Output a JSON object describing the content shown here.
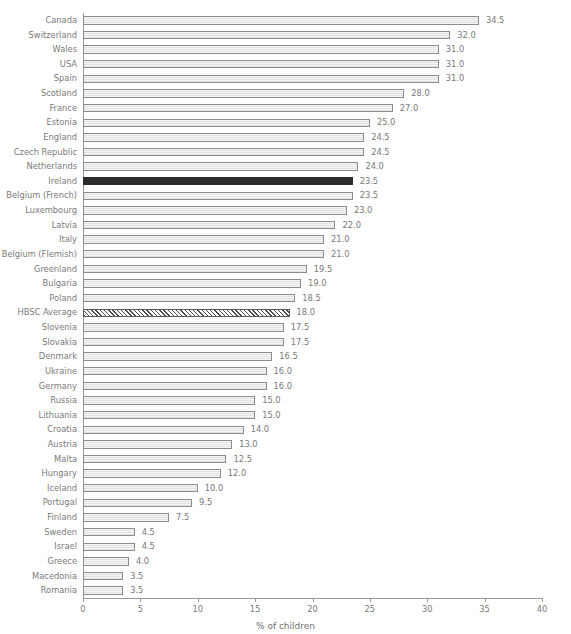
{
  "chart_data": {
    "type": "bar",
    "orientation": "horizontal",
    "title": "",
    "subtitle": "",
    "xlabel": "% of children",
    "ylabel": "",
    "xlim": [
      0,
      40
    ],
    "xticks": [
      0,
      5,
      10,
      15,
      20,
      25,
      30,
      35,
      40
    ],
    "xtick_labels": [
      "0",
      "5",
      "10",
      "15",
      "20",
      "25",
      "30",
      "35",
      "40"
    ],
    "grid": false,
    "legend": null,
    "value_label_format": "one-decimal",
    "categories": [
      "Canada",
      "Switzerland",
      "Wales",
      "USA",
      "Spain",
      "Scotland",
      "France",
      "Estonia",
      "England",
      "Czech Republic",
      "Netherlands",
      "Ireland",
      "Belgium (French)",
      "Luxembourg",
      "Latvia",
      "Italy",
      "Belgium (Flemish)",
      "Greenland",
      "Bulgaria",
      "Poland",
      "HBSC Average",
      "Slovenia",
      "Slovakia",
      "Denmark",
      "Ukraine",
      "Germany",
      "Russia",
      "Lithuania",
      "Croatia",
      "Austria",
      "Malta",
      "Hungary",
      "Iceland",
      "Portugal",
      "Finland",
      "Sweden",
      "Israel",
      "Greece",
      "Macedonia",
      "Romania"
    ],
    "values": [
      34.5,
      32.0,
      31.0,
      31.0,
      31.0,
      28.0,
      27.0,
      25.0,
      24.5,
      24.5,
      24.0,
      23.5,
      23.5,
      23.0,
      22.0,
      21.0,
      21.0,
      19.5,
      19.0,
      18.5,
      18.0,
      17.5,
      17.5,
      16.5,
      16.0,
      16.0,
      15.0,
      15.0,
      14.0,
      13.0,
      12.5,
      12.0,
      10.0,
      9.5,
      7.5,
      4.5,
      4.5,
      4.0,
      3.5,
      3.5
    ],
    "value_labels": [
      "34.5",
      "32.0",
      "31.0",
      "31.0",
      "31.0",
      "28.0",
      "27.0",
      "25.0",
      "24.5",
      "24.5",
      "24.0",
      "23.5",
      "23.5",
      "23.0",
      "22.0",
      "21.0",
      "21.0",
      "19.5",
      "19.0",
      "18.5",
      "18.0",
      "17.5",
      "17.5",
      "16.5",
      "16.0",
      "16.0",
      "15.0",
      "15.0",
      "14.0",
      "13.0",
      "12.5",
      "12.0",
      "10.0",
      "9.5",
      "7.5",
      "4.5",
      "4.5",
      "4.0",
      "3.5",
      "3.5"
    ],
    "styles": {
      "Ireland": "highlight",
      "HBSC Average": "hatch"
    },
    "colors": {
      "bar_fill": "#eeeeee",
      "bar_edge": "#8c8c8c",
      "highlight_fill": "#2b2b2b",
      "hatch_fill": "#4a4a4a",
      "text": "#7a7a7a",
      "axis": "#9a9a9a",
      "background": "#ffffff"
    }
  }
}
